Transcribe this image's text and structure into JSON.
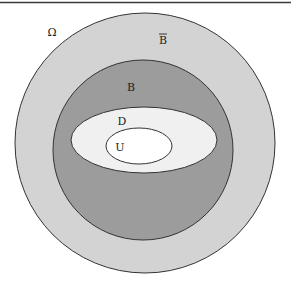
{
  "diagram": {
    "type": "nested-set-diagram",
    "top_rule": {
      "y": 2.5,
      "color": "#3a3a3a"
    },
    "regions": [
      {
        "id": "omega",
        "label": "Ω",
        "shape": "background",
        "label_pos": [
          52,
          36
        ]
      },
      {
        "id": "b-complement",
        "label": "B",
        "overbar": true,
        "shape": "circle",
        "cx": 145,
        "cy": 143,
        "r": 130,
        "fill": "#d3d3d3",
        "label_pos": [
          163,
          44
        ]
      },
      {
        "id": "b",
        "label": "B",
        "shape": "circle",
        "cx": 143,
        "cy": 150,
        "r": 90,
        "fill": "#9c9c9c",
        "label_pos": [
          131,
          91
        ]
      },
      {
        "id": "d",
        "label": "D",
        "shape": "ellipse",
        "cx": 144,
        "cy": 140,
        "rx": 73,
        "ry": 33,
        "fill": "#f0f0f0",
        "label_pos": [
          122,
          125
        ]
      },
      {
        "id": "u",
        "label": "U",
        "shape": "ellipse",
        "cx": 139,
        "cy": 146,
        "rx": 33,
        "ry": 18,
        "fill": "#ffffff",
        "label_pos": [
          120,
          151
        ]
      }
    ],
    "stroke_color": "#333333"
  }
}
